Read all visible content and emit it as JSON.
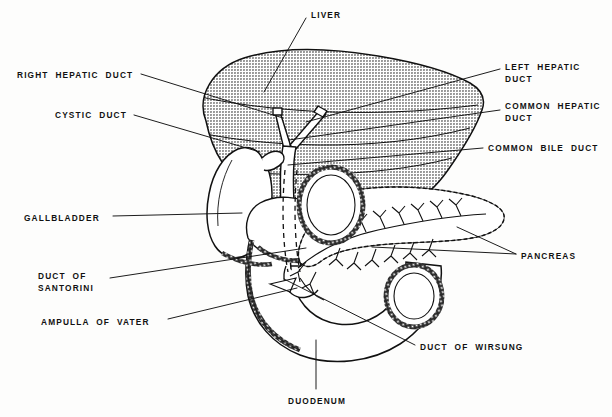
{
  "figure": {
    "background_color": "#fdfdfc",
    "ink_color": "#111111",
    "liver_fill": "#b6b6b6",
    "organ_fill": "#ffffff"
  },
  "labels": [
    {
      "id": "liver",
      "text": "LIVER",
      "x": 311,
      "y": 10,
      "align": "left"
    },
    {
      "id": "right-hepatic-duct",
      "text": "RIGHT  HEPATIC  DUCT",
      "x": 17,
      "y": 70,
      "align": "left"
    },
    {
      "id": "left-hepatic-duct",
      "text": "LEFT  HEPATIC\nDUCT",
      "x": 505,
      "y": 62,
      "align": "left"
    },
    {
      "id": "cystic-duct",
      "text": "CYSTIC  DUCT",
      "x": 55,
      "y": 110,
      "align": "left"
    },
    {
      "id": "common-hepatic-duct",
      "text": "COMMON  HEPATIC\nDUCT",
      "x": 505,
      "y": 101,
      "align": "left"
    },
    {
      "id": "common-bile-duct",
      "text": "COMMON  BILE  DUCT",
      "x": 488,
      "y": 143,
      "align": "left"
    },
    {
      "id": "gallbladder",
      "text": "GALLBLADDER",
      "x": 24,
      "y": 213,
      "align": "left"
    },
    {
      "id": "pancreas",
      "text": "PANCREAS",
      "x": 521,
      "y": 251,
      "align": "left"
    },
    {
      "id": "duct-of-santorini",
      "text": "DUCT  OF\nSANTORINI",
      "x": 38,
      "y": 271,
      "align": "left"
    },
    {
      "id": "ampulla-of-vater",
      "text": "AMPULLA  OF  VATER",
      "x": 41,
      "y": 317,
      "align": "left"
    },
    {
      "id": "duct-of-wirsung",
      "text": "DUCT  OF  WIRSUNG",
      "x": 420,
      "y": 342,
      "align": "left"
    },
    {
      "id": "duodenum",
      "text": "DUODENUM",
      "x": 288,
      "y": 396,
      "align": "center"
    }
  ],
  "leaders": [
    {
      "id": "leader-liver",
      "points": "306,18 264,92"
    },
    {
      "id": "leader-right-hepatic-duct",
      "points": "141,74 283,118"
    },
    {
      "id": "leader-left-hepatic-duct",
      "points": "500,69 306,122"
    },
    {
      "id": "leader-cystic-duct",
      "points": "134,115 260,152"
    },
    {
      "id": "leader-common-hepatic-duct",
      "points": "500,110 289,140"
    },
    {
      "id": "leader-common-bile-duct",
      "points": "483,148 288,165"
    },
    {
      "id": "leader-gallbladder",
      "points": "113,216 242,213"
    },
    {
      "id": "leader-pancreas-upper",
      "points": "516,254 457,227"
    },
    {
      "id": "leader-pancreas-lower",
      "points": "516,254 372,247"
    },
    {
      "id": "leader-duct-of-santorini",
      "points": "110,278 306,248"
    },
    {
      "id": "leader-ampulla-of-vater",
      "points": "168,319 297,288"
    },
    {
      "id": "leader-duct-of-wirsung",
      "points": "415,345 284,279"
    },
    {
      "id": "leader-duodenum",
      "points": "316,389 316,340"
    }
  ],
  "organs": [
    {
      "id": "liver",
      "name": "liver"
    },
    {
      "id": "gallbladder",
      "name": "gallbladder"
    },
    {
      "id": "pancreas",
      "name": "pancreas"
    },
    {
      "id": "duodenum",
      "name": "duodenum"
    },
    {
      "id": "bile-duct-tree",
      "name": "bile-duct-tree"
    }
  ]
}
